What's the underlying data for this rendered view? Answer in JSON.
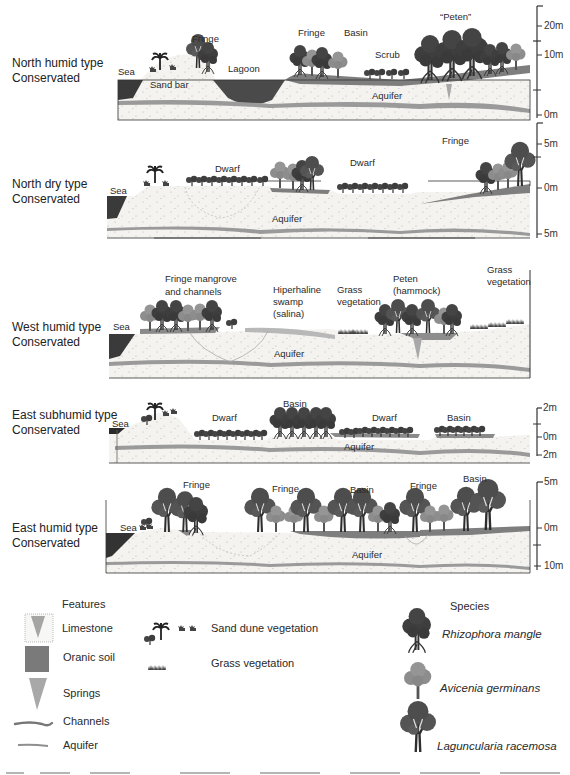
{
  "colors": {
    "sand": "#f4f3ef",
    "sand_dots": "#b9b9b9",
    "aquifer": "#9a9a9a",
    "organic_soil": "#7e7e7e",
    "sea": "#3a3a3a",
    "lagoon": "#4a4a4a",
    "rhizophora": "#3e3e3e",
    "avicenia": "#8d8d8d",
    "laguncularia": "#545454",
    "salina": "#b8b8b8",
    "spring": "#a8a8a8",
    "outline": "#333333"
  },
  "profiles": [
    {
      "id": "north-humid",
      "label_line1": "North humid type",
      "label_line2": "Conservated",
      "labels": [
        {
          "text": "Sea"
        },
        {
          "text": "Sand bar"
        },
        {
          "text": "Fringe"
        },
        {
          "text": "Lagoon"
        },
        {
          "text": "Fringe"
        },
        {
          "text": "Basin"
        },
        {
          "text": "Scrub"
        },
        {
          "text": "“Peten”"
        },
        {
          "text": "Aquifer"
        }
      ],
      "scale_ticks": [
        "20m",
        "10m",
        "0m"
      ]
    },
    {
      "id": "north-dry",
      "label_line1": "North dry type",
      "label_line2": "Conservated",
      "labels": [
        {
          "text": "Sea"
        },
        {
          "text": "Dwarf"
        },
        {
          "text": "Dwarf"
        },
        {
          "text": "Fringe"
        },
        {
          "text": "Aquifer"
        }
      ],
      "scale_ticks": [
        "5m",
        "0m",
        "5m"
      ]
    },
    {
      "id": "west-humid",
      "label_line1": "West humid type",
      "label_line2": "Conservated",
      "labels": [
        {
          "text": "Sea"
        },
        {
          "text": "Fringe mangrove",
          "text2": "and channels"
        },
        {
          "text": "Hiperhaline",
          "text2": "swamp",
          "text3": "(salina)"
        },
        {
          "text": "Grass",
          "text2": "vegetation"
        },
        {
          "text": "Peten",
          "text2": "(hammock)"
        },
        {
          "text": "Grass",
          "text2": "vegetation"
        },
        {
          "text": "Aquifer"
        }
      ],
      "scale_ticks": []
    },
    {
      "id": "east-subhumid",
      "label_line1": "East subhumid type",
      "label_line2": "Conservated",
      "labels": [
        {
          "text": "Sea"
        },
        {
          "text": "Dwarf"
        },
        {
          "text": "Basin"
        },
        {
          "text": "Dwarf"
        },
        {
          "text": "Basin"
        },
        {
          "text": "Aquifer"
        }
      ],
      "scale_ticks": [
        "2m",
        "0m",
        "2m"
      ]
    },
    {
      "id": "east-humid",
      "label_line1": "East humid type",
      "label_line2": "Conservated",
      "labels": [
        {
          "text": "Sea"
        },
        {
          "text": "Fringe"
        },
        {
          "text": "Fringe"
        },
        {
          "text": "Basin"
        },
        {
          "text": "Fringe"
        },
        {
          "text": "Basin"
        },
        {
          "text": "Aquifer"
        }
      ],
      "scale_ticks": [
        "5m",
        "0m",
        "10m"
      ]
    }
  ],
  "legend": {
    "features_title": "Features",
    "features": [
      {
        "icon": "limestone-icon",
        "label": "Limestone"
      },
      {
        "icon": "organic-soil-icon",
        "label": "Oranic soil"
      },
      {
        "icon": "springs-icon",
        "label": "Springs"
      },
      {
        "icon": "channels-icon",
        "label": "Channels"
      },
      {
        "icon": "aquifer-icon",
        "label": "Aquifer"
      }
    ],
    "vegetation": [
      {
        "icon": "sand-dune-vegetation-icon",
        "label": "Sand dune vegetation"
      },
      {
        "icon": "grass-vegetation-icon",
        "label": "Grass vegetation"
      }
    ],
    "species_title": "Species",
    "species": [
      {
        "icon": "rhizophora-tree-icon",
        "label": "Rhizophora mangle"
      },
      {
        "icon": "avicenia-tree-icon",
        "label": "Avicenia germinans"
      },
      {
        "icon": "laguncularia-tree-icon",
        "label": "Laguncularia racemosa"
      }
    ]
  }
}
